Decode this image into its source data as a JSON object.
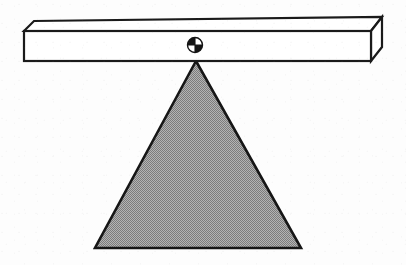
{
  "figure": {
    "description": "Black-and-white line drawing of a horizontal three-dimensional beam resting on a solid gray triangular fulcrum, with a small quadrant-marked circular pivot point on the beam directly above the triangle apex.",
    "background_color": "#fdfdfd"
  },
  "beam": {
    "name": "lever-beam",
    "fill_color": "#ffffff",
    "stroke_color": "#1a1a1a",
    "stroke_width": 2.2,
    "front_face": {
      "x": 24,
      "y": 31,
      "width": 347,
      "height": 30
    },
    "top_face_points": "24,31 34,21 382,17 371,31",
    "end_face_points": "371,31 382,17 382,47 371,61",
    "depth_offset_x": 11,
    "depth_offset_y": -11
  },
  "pivot": {
    "name": "pivot-marker",
    "center_x": 195,
    "center_y": 45,
    "radius": 7.5,
    "fill_color": "#141414",
    "highlight_color": "#ffffff",
    "stroke_color": "#141414",
    "style": "quadrant-divided-circle"
  },
  "fulcrum": {
    "name": "triangular-fulcrum",
    "apex_x": 196,
    "apex_y": 61,
    "left_base_x": 95,
    "left_base_y": 248,
    "right_base_x": 301,
    "right_base_y": 248,
    "fill_color": "#9a9a9a",
    "pattern": "50-percent-halftone-dither",
    "stroke_color": "#161616",
    "stroke_width": 2.6
  },
  "labels": {
    "beam": "Beam",
    "pivot": "Pivot",
    "fulcrum": "Fulcrum"
  }
}
